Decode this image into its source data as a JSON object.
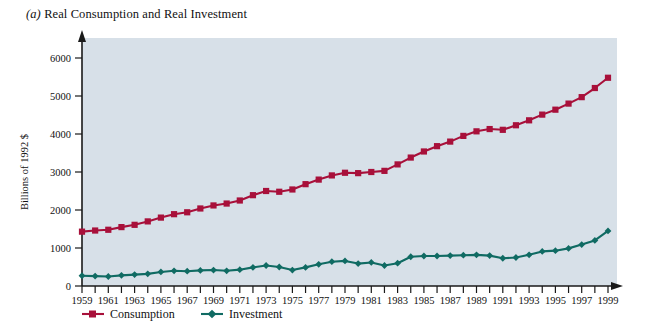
{
  "figure": {
    "panel_label": "(a)",
    "title": "Real Consumption and Real Investment",
    "title_full": "(a) Real Consumption and Real Investment",
    "background_color": "#ffffff",
    "plot_background_color": "#d7e0e8"
  },
  "legend": {
    "position": "bottom",
    "items": [
      {
        "label": "Consumption",
        "color": "#a8103a",
        "marker": "square"
      },
      {
        "label": "Investment",
        "color": "#106b63",
        "marker": "diamond"
      }
    ]
  },
  "axes": {
    "y_label": "Billions of 1992 $",
    "y_ticks": [
      "0",
      "1000",
      "2000",
      "3000",
      "4000",
      "5000",
      "6000"
    ],
    "x_tick_labels": [
      "1959",
      "1961",
      "1963",
      "1965",
      "1967",
      "1969",
      "1971",
      "1973",
      "1975",
      "1977",
      "1979",
      "1981",
      "1983",
      "1985",
      "1987",
      "1989",
      "1991",
      "1993",
      "1995",
      "1997",
      "1999"
    ]
  },
  "chart_data": {
    "type": "line",
    "title": "(a) Real Consumption and Real Investment",
    "xlabel": "",
    "ylabel": "Billions of 1992 $",
    "ylim": [
      0,
      6400
    ],
    "xlim": [
      1959,
      1999
    ],
    "grid": false,
    "legend_position": "bottom",
    "x": [
      1959,
      1960,
      1961,
      1962,
      1963,
      1964,
      1965,
      1966,
      1967,
      1968,
      1969,
      1970,
      1971,
      1972,
      1973,
      1974,
      1975,
      1976,
      1977,
      1978,
      1979,
      1980,
      1981,
      1982,
      1983,
      1984,
      1985,
      1986,
      1987,
      1988,
      1989,
      1990,
      1991,
      1992,
      1993,
      1994,
      1995,
      1996,
      1997,
      1998,
      1999
    ],
    "series": [
      {
        "name": "Consumption",
        "color": "#a8103a",
        "marker": "square",
        "values": [
          1430,
          1460,
          1480,
          1550,
          1610,
          1700,
          1800,
          1890,
          1940,
          2040,
          2120,
          2170,
          2250,
          2390,
          2500,
          2480,
          2540,
          2680,
          2800,
          2910,
          2980,
          2970,
          3000,
          3030,
          3200,
          3380,
          3540,
          3680,
          3800,
          3950,
          4070,
          4130,
          4110,
          4230,
          4360,
          4510,
          4640,
          4800,
          4970,
          5210,
          5480
        ]
      },
      {
        "name": "Investment",
        "color": "#106b63",
        "marker": "diamond",
        "values": [
          270,
          260,
          250,
          280,
          300,
          320,
          370,
          400,
          390,
          410,
          420,
          400,
          430,
          490,
          540,
          500,
          420,
          490,
          570,
          640,
          660,
          590,
          620,
          540,
          600,
          770,
          790,
          790,
          800,
          810,
          820,
          800,
          730,
          750,
          820,
          910,
          930,
          990,
          1090,
          1200,
          1450
        ]
      }
    ]
  }
}
